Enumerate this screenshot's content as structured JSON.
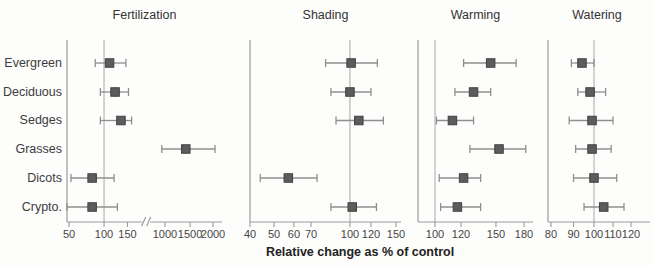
{
  "chart_data": {
    "type": "scatter",
    "subtype": "forest-plot-with-error-bars",
    "title": "",
    "xlabel": "Relative change as % of control",
    "categories": [
      "Evergreen",
      "Deciduous",
      "Sedges",
      "Grasses",
      "Dicots",
      "Crypto."
    ],
    "style": {
      "marker_fill": "#5c5c5c",
      "marker_stroke": "#404040",
      "errorbar_color": "#8f8f8f",
      "axis_color": "#9b9b9b",
      "reference_line_color": "#a8a8a8",
      "text_color": "#3f3f3f",
      "background": "#fdfdfc"
    },
    "panels": [
      {
        "title": "Fertilization",
        "scale": "log",
        "axis_break": true,
        "break_between": [
          150,
          1000
        ],
        "reference_value": 100,
        "ticks": [
          {
            "value": 50,
            "label": "50",
            "frac": 0.013
          },
          {
            "value": 100,
            "label": "100",
            "frac": 0.239
          },
          {
            "value": 150,
            "label": "150",
            "frac": 0.39
          },
          {
            "value": 1000,
            "label": "1000",
            "frac": 0.632
          },
          {
            "value": 1500,
            "label": "1500",
            "frac": 0.794
          },
          {
            "value": 2000,
            "label": "2000",
            "frac": 0.942
          }
        ],
        "series": [
          {
            "category": "Evergreen",
            "value": 110,
            "ci_low": 84,
            "ci_high": 146
          },
          {
            "category": "Deciduous",
            "value": 121,
            "ci_low": 93,
            "ci_high": 158
          },
          {
            "category": "Sedges",
            "value": 134,
            "ci_low": 93,
            "ci_high": 185
          },
          {
            "category": "Grasses",
            "value": 1400,
            "ci_low": 850,
            "ci_high": 2050
          },
          {
            "category": "Dicots",
            "value": 79,
            "ci_low": 52,
            "ci_high": 119
          },
          {
            "category": "Crypto.",
            "value": 79,
            "ci_low": 48,
            "ci_high": 126
          }
        ]
      },
      {
        "title": "Shading",
        "scale": "log",
        "axis_break": false,
        "reference_value": 100,
        "ticks": [
          {
            "value": 40,
            "label": "40",
            "frac": 0.0
          },
          {
            "value": 50,
            "label": "50",
            "frac": 0.159
          },
          {
            "value": 60,
            "label": "60",
            "frac": 0.291
          },
          {
            "value": 70,
            "label": "70",
            "frac": 0.404
          },
          {
            "value": 100,
            "label": "100",
            "frac": 0.662
          },
          {
            "value": 120,
            "label": "120",
            "frac": 0.801
          },
          {
            "value": 150,
            "label": "150",
            "frac": 0.967
          }
        ],
        "series": [
          {
            "category": "Evergreen",
            "value": 101,
            "ci_low": 80,
            "ci_high": 127
          },
          {
            "category": "Deciduous",
            "value": 100,
            "ci_low": 84,
            "ci_high": 120
          },
          {
            "category": "Sedges",
            "value": 108,
            "ci_low": 88,
            "ci_high": 134
          },
          {
            "category": "Grasses",
            "value": null,
            "ci_low": null,
            "ci_high": null
          },
          {
            "category": "Dicots",
            "value": 57,
            "ci_low": 44,
            "ci_high": 74
          },
          {
            "category": "Crypto.",
            "value": 102,
            "ci_low": 84,
            "ci_high": 126
          }
        ]
      },
      {
        "title": "Warming",
        "scale": "log",
        "axis_break": false,
        "reference_value": 100,
        "ticks": [
          {
            "value": 100,
            "label": "100",
            "frac": 0.148
          },
          {
            "value": 120,
            "label": "120",
            "frac": 0.374
          },
          {
            "value": 150,
            "label": "150",
            "frac": 0.678
          },
          {
            "value": 180,
            "label": "180",
            "frac": 0.922
          }
        ],
        "series": [
          {
            "category": "Evergreen",
            "value": 145,
            "ci_low": 122,
            "ci_high": 171
          },
          {
            "category": "Deciduous",
            "value": 130,
            "ci_low": 115,
            "ci_high": 145
          },
          {
            "category": "Sedges",
            "value": 113,
            "ci_low": 101,
            "ci_high": 130
          },
          {
            "category": "Grasses",
            "value": 153,
            "ci_low": 127,
            "ci_high": 182
          },
          {
            "category": "Dicots",
            "value": 122,
            "ci_low": 103,
            "ci_high": 136
          },
          {
            "category": "Crypto.",
            "value": 117,
            "ci_low": 104,
            "ci_high": 136
          }
        ]
      },
      {
        "title": "Watering",
        "scale": "log",
        "axis_break": false,
        "reference_value": 100,
        "ticks": [
          {
            "value": 80,
            "label": "80",
            "frac": 0.029
          },
          {
            "value": 90,
            "label": "90",
            "frac": 0.25
          },
          {
            "value": 100,
            "label": "100",
            "frac": 0.451
          },
          {
            "value": 110,
            "label": "110",
            "frac": 0.637
          },
          {
            "value": 120,
            "label": "120",
            "frac": 0.814
          }
        ],
        "series": [
          {
            "category": "Evergreen",
            "value": 94,
            "ci_low": 89,
            "ci_high": 100
          },
          {
            "category": "Deciduous",
            "value": 98,
            "ci_low": 92,
            "ci_high": 106
          },
          {
            "category": "Sedges",
            "value": 99,
            "ci_low": 88,
            "ci_high": 110
          },
          {
            "category": "Grasses",
            "value": 99,
            "ci_low": 91,
            "ci_high": 109
          },
          {
            "category": "Dicots",
            "value": 100,
            "ci_low": 90,
            "ci_high": 112
          },
          {
            "category": "Crypto.",
            "value": 105,
            "ci_low": 95,
            "ci_high": 116
          }
        ]
      }
    ]
  }
}
